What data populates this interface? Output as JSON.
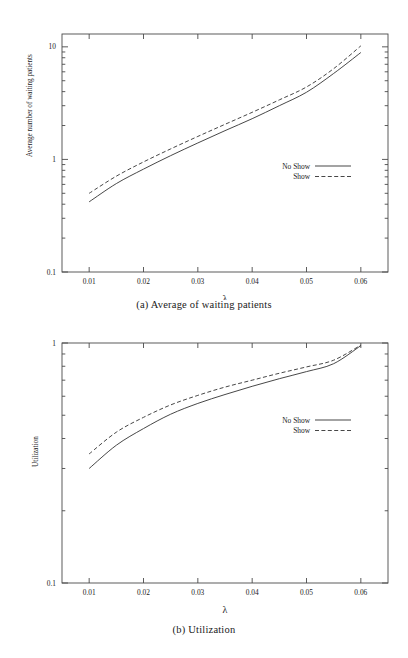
{
  "figure_a": {
    "caption": "(a)  Average of waiting patients",
    "ylabel": "Average number of waiting patients",
    "xlabel": "λ",
    "ytick_labels": [
      "10",
      "1",
      "0.1"
    ],
    "xtick_labels": [
      "0.01",
      "0.02",
      "0.03",
      "0.04",
      "0.05",
      "0.06"
    ],
    "legend": [
      {
        "label": "No Show",
        "style": "solid"
      },
      {
        "label": "Show",
        "style": "dashed"
      }
    ]
  },
  "figure_b": {
    "caption": "(b)  Utilization",
    "ylabel": "Utilization",
    "xlabel": "λ",
    "ytick_labels": [
      "1"
    ],
    "xtick_labels": [
      "0.01",
      "0.02",
      "0.03",
      "0.04",
      "0.05",
      "0.06"
    ],
    "legend": [
      {
        "label": "No Show",
        "style": "solid"
      },
      {
        "label": "Show",
        "style": "dashed"
      }
    ]
  },
  "chart_data": [
    {
      "type": "line",
      "id": "a",
      "title": "(a)  Average of waiting patients",
      "xlabel": "λ",
      "ylabel": "Average number of waiting patients",
      "xscale": "linear",
      "yscale": "log",
      "xlim": [
        0.005,
        0.065
      ],
      "ylim": [
        0.1,
        13.0
      ],
      "xticks": [
        0.01,
        0.02,
        0.03,
        0.04,
        0.05,
        0.06
      ],
      "yticks": [
        0.1,
        1,
        10
      ],
      "grid": false,
      "legend_position": "center-right",
      "x": [
        0.01,
        0.015,
        0.02,
        0.025,
        0.03,
        0.035,
        0.04,
        0.045,
        0.05,
        0.055,
        0.06
      ],
      "series": [
        {
          "name": "No Show",
          "style": "solid",
          "values": [
            0.42,
            0.61,
            0.82,
            1.08,
            1.4,
            1.8,
            2.3,
            3.0,
            3.95,
            5.8,
            8.9
          ]
        },
        {
          "name": "Show",
          "style": "dashed",
          "values": [
            0.5,
            0.71,
            0.95,
            1.24,
            1.6,
            2.05,
            2.62,
            3.38,
            4.4,
            6.4,
            10.2
          ]
        }
      ]
    },
    {
      "type": "line",
      "id": "b",
      "title": "(b)  Utilization",
      "xlabel": "λ",
      "ylabel": "Utilization",
      "xscale": "linear",
      "yscale": "log",
      "xlim": [
        0.005,
        0.065
      ],
      "ylim": [
        0.1,
        1.0
      ],
      "xticks": [
        0.01,
        0.02,
        0.03,
        0.04,
        0.05,
        0.06
      ],
      "yticks": [
        1
      ],
      "grid": false,
      "legend_position": "center-right",
      "x": [
        0.01,
        0.015,
        0.02,
        0.025,
        0.03,
        0.035,
        0.04,
        0.045,
        0.05,
        0.055,
        0.06
      ],
      "series": [
        {
          "name": "No Show",
          "style": "solid",
          "values": [
            0.3,
            0.375,
            0.44,
            0.505,
            0.56,
            0.61,
            0.66,
            0.71,
            0.76,
            0.82,
            0.975
          ]
        },
        {
          "name": "Show",
          "style": "dashed",
          "values": [
            0.345,
            0.425,
            0.49,
            0.552,
            0.605,
            0.655,
            0.7,
            0.748,
            0.795,
            0.848,
            0.98
          ]
        }
      ]
    }
  ]
}
